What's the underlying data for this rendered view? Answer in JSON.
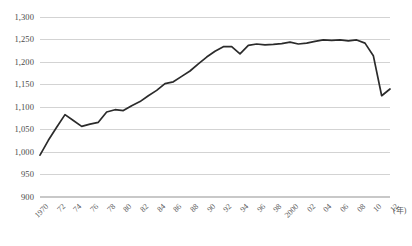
{
  "chart_data": {
    "type": "line",
    "title": "",
    "subtitle": "",
    "xlabel": "(年)",
    "ylabel": "",
    "grid": true,
    "legend": false,
    "xlim": [
      1970,
      2012
    ],
    "ylim": [
      900,
      1300
    ],
    "y_ticks": [
      900,
      950,
      1000,
      1050,
      1100,
      1150,
      1200,
      1250,
      1300
    ],
    "y_tick_labels": [
      "900",
      "950",
      "1,000",
      "1,050",
      "1,100",
      "1,150",
      "1,200",
      "1,250",
      "1,300"
    ],
    "x_ticks": [
      1970,
      1972,
      1974,
      1976,
      1978,
      1980,
      1982,
      1984,
      1986,
      1988,
      1990,
      1992,
      1994,
      1996,
      1998,
      2000,
      2002,
      2004,
      2006,
      2008,
      2010,
      2012
    ],
    "x_tick_labels": [
      "1970",
      "72",
      "74",
      "76",
      "78",
      "80",
      "82",
      "84",
      "86",
      "88",
      "90",
      "92",
      "94",
      "96",
      "98",
      "2000",
      "02",
      "04",
      "06",
      "08",
      "10",
      "12"
    ],
    "line_color": "#2b2b2b",
    "grid_color": "#c8c8c8",
    "x": [
      1970,
      1971,
      1972,
      1973,
      1974,
      1975,
      1976,
      1977,
      1978,
      1979,
      1980,
      1981,
      1982,
      1983,
      1984,
      1985,
      1986,
      1987,
      1988,
      1989,
      1990,
      1991,
      1992,
      1993,
      1994,
      1995,
      1996,
      1997,
      1998,
      1999,
      2000,
      2001,
      2002,
      2003,
      2004,
      2005,
      2006,
      2007,
      2008,
      2009,
      2010,
      2011,
      2012
    ],
    "values": [
      993,
      1026,
      1055,
      1083,
      1070,
      1057,
      1062,
      1066,
      1089,
      1094,
      1092,
      1103,
      1112,
      1125,
      1137,
      1152,
      1156,
      1168,
      1180,
      1196,
      1211,
      1224,
      1234,
      1234,
      1218,
      1237,
      1240,
      1238,
      1239,
      1241,
      1244,
      1240,
      1242,
      1246,
      1249,
      1248,
      1249,
      1247,
      1249,
      1242,
      1214,
      1125,
      1140
    ],
    "series": [
      {
        "name": "",
        "values": [
          993,
          1026,
          1055,
          1083,
          1070,
          1057,
          1062,
          1066,
          1089,
          1094,
          1092,
          1103,
          1112,
          1125,
          1137,
          1152,
          1156,
          1168,
          1180,
          1196,
          1211,
          1224,
          1234,
          1234,
          1218,
          1237,
          1240,
          1238,
          1239,
          1241,
          1244,
          1240,
          1242,
          1246,
          1249,
          1248,
          1249,
          1247,
          1249,
          1242,
          1214,
          1125,
          1140
        ]
      }
    ]
  }
}
